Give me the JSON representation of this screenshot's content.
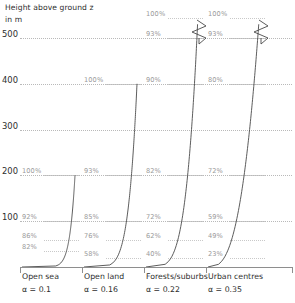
{
  "axis_title": {
    "line1": "Height above ground z",
    "line2": "in m"
  },
  "y_axis": {
    "label": "Height above ground z in m",
    "unit": "m",
    "ticks": [
      100,
      200,
      300,
      400,
      500
    ],
    "tick_labels": [
      "100",
      "200",
      "300",
      "400",
      "500"
    ]
  },
  "colors": {
    "curve": "#4a4a4a",
    "axis": "#8e8e8e",
    "gridline": "#b9b9b9",
    "percent_label": "#9a9a9a",
    "text": "#2e2e2e",
    "background": "#ffffff"
  },
  "columns": [
    {
      "name": "Open sea",
      "alpha_label": "α = 0.1",
      "alpha": 0.1,
      "gradient_height": 200,
      "has_break": false,
      "points": [
        {
          "label": "100%",
          "value": 100,
          "height": 200
        },
        {
          "label": "92%",
          "value": 92,
          "height": 100
        },
        {
          "label": "86%",
          "value": 86,
          "height": 60
        },
        {
          "label": "82%",
          "value": 82,
          "height": 35
        }
      ]
    },
    {
      "name": "Open land",
      "alpha_label": "α = 0.16",
      "alpha": 0.16,
      "gradient_height": 400,
      "has_break": false,
      "points": [
        {
          "label": "100%",
          "value": 100,
          "height": 400
        },
        {
          "label": "93%",
          "value": 93,
          "height": 200
        },
        {
          "label": "85%",
          "value": 85,
          "height": 100
        },
        {
          "label": "76%",
          "value": 76,
          "height": 60
        },
        {
          "label": "58%",
          "value": 58,
          "height": 20
        }
      ]
    },
    {
      "name": "Forests/suburbs",
      "alpha_label": "α = 0.22",
      "alpha": 0.22,
      "gradient_height": 600,
      "has_break": true,
      "points": [
        {
          "label": "100%",
          "value": 100,
          "height": 600
        },
        {
          "label": "93%",
          "value": 93,
          "height": 500
        },
        {
          "label": "90%",
          "value": 90,
          "height": 400
        },
        {
          "label": "82%",
          "value": 82,
          "height": 200
        },
        {
          "label": "72%",
          "value": 72,
          "height": 100
        },
        {
          "label": "62%",
          "value": 62,
          "height": 60
        },
        {
          "label": "40%",
          "value": 40,
          "height": 20
        }
      ]
    },
    {
      "name": "Urban centres",
      "alpha_label": "α = 0.35",
      "alpha": 0.35,
      "gradient_height": 600,
      "has_break": true,
      "points": [
        {
          "label": "100%",
          "value": 100,
          "height": 600
        },
        {
          "label": "93%",
          "value": 93,
          "height": 500
        },
        {
          "label": "80%",
          "value": 80,
          "height": 400
        },
        {
          "label": "72%",
          "value": 72,
          "height": 200
        },
        {
          "label": "59%",
          "value": 59,
          "height": 100
        },
        {
          "label": "49%",
          "value": 49,
          "height": 60
        },
        {
          "label": "23%",
          "value": 23,
          "height": 20
        }
      ]
    }
  ],
  "chart_data": {
    "type": "line",
    "title": "Height above ground z in m",
    "xlabel": "",
    "ylabel": "Height above ground z in m",
    "ylim": [
      0,
      500
    ],
    "grid": true,
    "legend": "none",
    "yticks": [
      100,
      200,
      300,
      400,
      500
    ],
    "note": "Wind speed profiles as percentage of gradient wind speed versus height above ground for four terrain roughness categories; columns 3 and 4 use an axis break above 500 m.",
    "series": [
      {
        "name": "Open sea",
        "alpha": 0.1,
        "gradient_height": 200,
        "x": [
          82,
          86,
          92,
          100
        ],
        "y": [
          35,
          60,
          100,
          200
        ],
        "labels": [
          "82%",
          "86%",
          "92%",
          "100%"
        ]
      },
      {
        "name": "Open land",
        "alpha": 0.16,
        "gradient_height": 400,
        "x": [
          58,
          76,
          85,
          93,
          100
        ],
        "y": [
          20,
          60,
          100,
          200,
          400
        ],
        "labels": [
          "58%",
          "76%",
          "85%",
          "93%",
          "100%"
        ]
      },
      {
        "name": "Forests/suburbs",
        "alpha": 0.22,
        "gradient_height": 600,
        "x": [
          40,
          62,
          72,
          82,
          90,
          93,
          100
        ],
        "y": [
          20,
          60,
          100,
          200,
          400,
          500,
          600
        ],
        "labels": [
          "40%",
          "62%",
          "72%",
          "82%",
          "90%",
          "93%",
          "100%"
        ]
      },
      {
        "name": "Urban centres",
        "alpha": 0.35,
        "gradient_height": 600,
        "x": [
          23,
          49,
          59,
          72,
          80,
          93,
          100
        ],
        "y": [
          20,
          60,
          100,
          200,
          400,
          500,
          600
        ],
        "labels": [
          "23%",
          "49%",
          "59%",
          "72%",
          "80%",
          "93%",
          "100%"
        ]
      }
    ]
  }
}
